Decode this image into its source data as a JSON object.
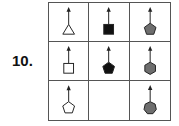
{
  "problem": {
    "number_label": "10."
  },
  "colors": {
    "outline": "#ffffff",
    "black": "#111111",
    "gray": "#6e6e6e",
    "stroke": "#222222",
    "grid_line": "#555555"
  },
  "matrix": {
    "rows": 3,
    "cols": 3,
    "cells": [
      {
        "row": 1,
        "col": 1,
        "shape": "triangle",
        "sides": 3,
        "fill": "outline",
        "arrow": "up"
      },
      {
        "row": 1,
        "col": 2,
        "shape": "square",
        "sides": 4,
        "fill": "black",
        "arrow": "up"
      },
      {
        "row": 1,
        "col": 3,
        "shape": "pentagon",
        "sides": 5,
        "fill": "gray",
        "arrow": "up"
      },
      {
        "row": 2,
        "col": 1,
        "shape": "square",
        "sides": 4,
        "fill": "outline",
        "arrow": "up"
      },
      {
        "row": 2,
        "col": 2,
        "shape": "pentagon",
        "sides": 5,
        "fill": "black",
        "arrow": "up"
      },
      {
        "row": 2,
        "col": 3,
        "shape": "hexagon",
        "sides": 6,
        "fill": "gray",
        "arrow": "up"
      },
      {
        "row": 3,
        "col": 1,
        "shape": "pentagon",
        "sides": 5,
        "fill": "outline",
        "arrow": "up"
      },
      {
        "row": 3,
        "col": 2,
        "shape": "empty",
        "sides": 0,
        "fill": "none",
        "arrow": "none"
      },
      {
        "row": 3,
        "col": 3,
        "shape": "heptagon",
        "sides": 7,
        "fill": "gray",
        "arrow": "up"
      }
    ]
  }
}
